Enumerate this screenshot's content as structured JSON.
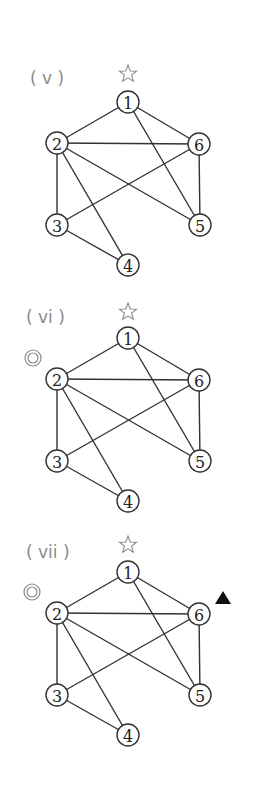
{
  "figure": {
    "width": 255,
    "height": 786,
    "colors": {
      "edge": "#333333",
      "node_stroke": "#333333",
      "label_gray": "#8a8a8a",
      "triangle": "#111111"
    },
    "node_layout": {
      "1": {
        "x": 128,
        "y": 102
      },
      "2": {
        "x": 57,
        "y": 143
      },
      "3": {
        "x": 57,
        "y": 225
      },
      "4": {
        "x": 128,
        "y": 265
      },
      "5": {
        "x": 200,
        "y": 225
      },
      "6": {
        "x": 199,
        "y": 144
      }
    },
    "node_radius": 11,
    "panels": [
      {
        "label": "( v )",
        "label_pos": {
          "x": 30,
          "y": 84
        },
        "offset_y": 0,
        "nodes": [
          "1",
          "2",
          "3",
          "4",
          "5",
          "6"
        ],
        "edges": [
          [
            "1",
            "2"
          ],
          [
            "1",
            "6"
          ],
          [
            "1",
            "5"
          ],
          [
            "2",
            "6"
          ],
          [
            "2",
            "3"
          ],
          [
            "2",
            "4"
          ],
          [
            "2",
            "5"
          ],
          [
            "3",
            "6"
          ],
          [
            "3",
            "4"
          ],
          [
            "6",
            "5"
          ]
        ],
        "markers": [
          {
            "type": "star",
            "symbol": "☆",
            "x": 128,
            "y": 74
          }
        ]
      },
      {
        "label": "( vi )",
        "label_pos": {
          "x": 26,
          "y": 323
        },
        "offset_y": 236,
        "nodes": [
          "1",
          "2",
          "3",
          "4",
          "5",
          "6"
        ],
        "edges": [
          [
            "1",
            "2"
          ],
          [
            "1",
            "6"
          ],
          [
            "1",
            "5"
          ],
          [
            "2",
            "6"
          ],
          [
            "2",
            "3"
          ],
          [
            "2",
            "4"
          ],
          [
            "2",
            "5"
          ],
          [
            "3",
            "6"
          ],
          [
            "3",
            "4"
          ],
          [
            "6",
            "5"
          ]
        ],
        "markers": [
          {
            "type": "star",
            "symbol": "☆",
            "x": 128,
            "y": 312
          },
          {
            "type": "double-circle",
            "symbol": "◎",
            "x": 33,
            "y": 358
          }
        ]
      },
      {
        "label": "( vii )",
        "label_pos": {
          "x": 26,
          "y": 558
        },
        "offset_y": 470,
        "nodes": [
          "1",
          "2",
          "3",
          "4",
          "5",
          "6"
        ],
        "edges": [
          [
            "1",
            "2"
          ],
          [
            "1",
            "6"
          ],
          [
            "1",
            "5"
          ],
          [
            "2",
            "6"
          ],
          [
            "2",
            "3"
          ],
          [
            "2",
            "4"
          ],
          [
            "2",
            "5"
          ],
          [
            "3",
            "6"
          ],
          [
            "3",
            "4"
          ],
          [
            "6",
            "5"
          ]
        ],
        "markers": [
          {
            "type": "star",
            "symbol": "☆",
            "x": 128,
            "y": 545
          },
          {
            "type": "double-circle",
            "symbol": "◎",
            "x": 32,
            "y": 592
          },
          {
            "type": "triangle",
            "symbol": "▲",
            "x": 223,
            "y": 598
          }
        ]
      }
    ]
  }
}
